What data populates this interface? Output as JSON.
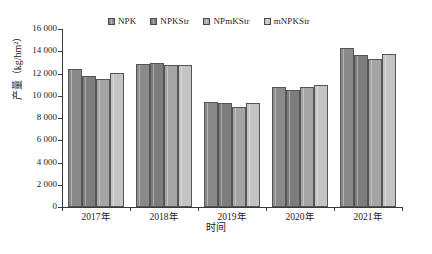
{
  "chart_data": {
    "type": "bar",
    "title": "",
    "xlabel": "时间",
    "ylabel": "产量（kg/hm²）",
    "categories": [
      "2017年",
      "2018年",
      "2019年",
      "2020年",
      "2021年"
    ],
    "ylim": [
      0,
      16000
    ],
    "ytick_step": 2000,
    "yticks": [
      "0",
      "2 000",
      "4 000",
      "6 000",
      "8 000",
      "10 000",
      "12 000",
      "14 000",
      "16 000"
    ],
    "ytick_values": [
      0,
      2000,
      4000,
      6000,
      8000,
      10000,
      12000,
      14000,
      16000
    ],
    "grid": false,
    "legend_position": "top-center",
    "series": [
      {
        "name": "NPK",
        "color": "#8a8a8a",
        "values": [
          12450,
          12880,
          9480,
          10800,
          14250
        ]
      },
      {
        "name": "NPKStr",
        "color": "#7d7d7d",
        "values": [
          11760,
          12980,
          9330,
          10500,
          13620
        ]
      },
      {
        "name": "NPmKStr",
        "color": "#a5a5a5",
        "values": [
          11500,
          12800,
          8950,
          10760,
          13340
        ]
      },
      {
        "name": "mNPKStr",
        "color": "#c4c4c4",
        "values": [
          12080,
          12810,
          9380,
          10980,
          13760
        ]
      }
    ]
  },
  "legend": {
    "entries": [
      {
        "label": "NPK"
      },
      {
        "label": "NPKStr"
      },
      {
        "label": "NPmKStr"
      },
      {
        "label": "mNPKStr"
      }
    ]
  },
  "axes": {
    "y_title": "产量（kg/hm²）",
    "x_title": "时间"
  }
}
